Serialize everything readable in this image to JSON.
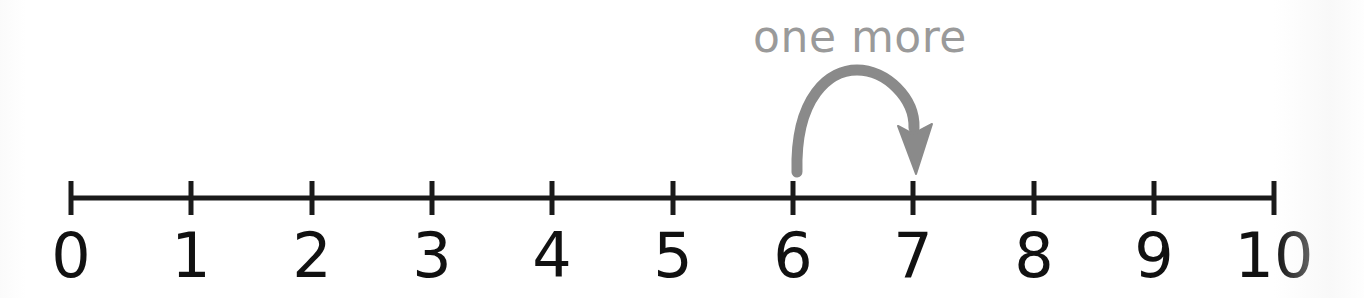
{
  "figure": {
    "kind": "number-line-diagram",
    "background_color": "#ffffff",
    "line_color": "#1a1a1a",
    "label_color": "#111111",
    "annotation_color": "#9a9a9a",
    "arrow_color": "#8a8a8a"
  },
  "annotation": {
    "text": "one more",
    "x": 860,
    "y": 38,
    "jump_from": "6",
    "jump_to": "7",
    "arrow_icon": "curved-jump-arrow-icon"
  },
  "number_line": {
    "axis_y": 198,
    "start_x": 71,
    "end_x": 1274,
    "tick_spacing": 120.3,
    "tick_half_height": 17,
    "label_baseline_y": 277,
    "ticks": [
      {
        "value": 0,
        "label": "0",
        "x": 71
      },
      {
        "value": 1,
        "label": "1",
        "x": 191
      },
      {
        "value": 2,
        "label": "2",
        "x": 312
      },
      {
        "value": 3,
        "label": "3",
        "x": 432
      },
      {
        "value": 4,
        "label": "4",
        "x": 552
      },
      {
        "value": 5,
        "label": "5",
        "x": 673
      },
      {
        "value": 6,
        "label": "6",
        "x": 793
      },
      {
        "value": 7,
        "label": "7",
        "x": 913
      },
      {
        "value": 8,
        "label": "8",
        "x": 1034
      },
      {
        "value": 9,
        "label": "9",
        "x": 1154
      },
      {
        "value": 10,
        "label": "10",
        "x": 1274
      }
    ]
  },
  "chart_data": {
    "type": "number-line",
    "title": "",
    "xlabel": "",
    "ylabel": "",
    "xlim": [
      0,
      10
    ],
    "grid": false,
    "categories": [
      "0",
      "1",
      "2",
      "3",
      "4",
      "5",
      "6",
      "7",
      "8",
      "9",
      "10"
    ],
    "values": [
      0,
      1,
      2,
      3,
      4,
      5,
      6,
      7,
      8,
      9,
      10
    ],
    "tick_labels": [
      "0",
      "1",
      "2",
      "3",
      "4",
      "5",
      "6",
      "7",
      "8",
      "9",
      "10"
    ],
    "annotations": [
      {
        "label": "one more",
        "type": "curved-arrow",
        "from": 6,
        "to": 7,
        "direction": "right",
        "color": "#8a8a8a"
      }
    ]
  }
}
